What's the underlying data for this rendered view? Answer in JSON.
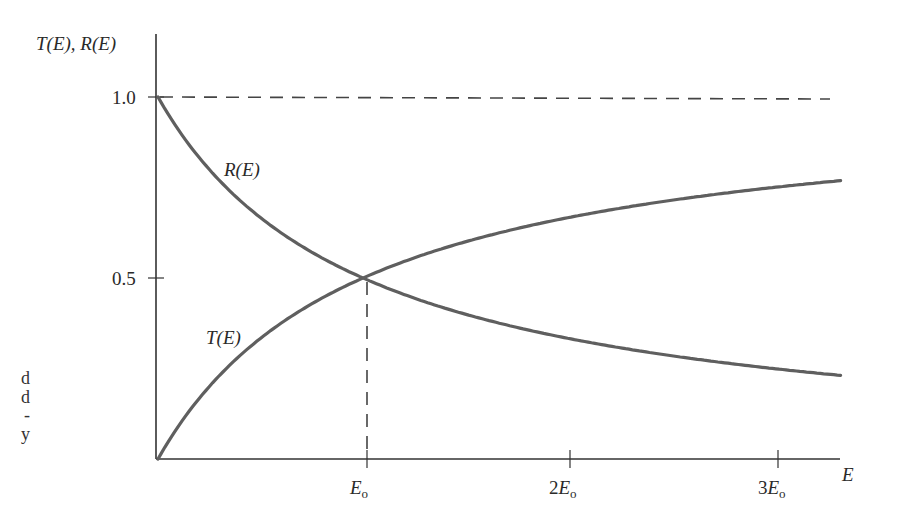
{
  "chart_data": {
    "type": "line",
    "title": "",
    "xlabel": "E",
    "ylabel": "T(E), R(E)",
    "x_ticks": [
      {
        "value": 1,
        "label": "E",
        "sub": "o"
      },
      {
        "value": 2,
        "label": "2E",
        "sub": "o"
      },
      {
        "value": 3,
        "label": "3E",
        "sub": "o"
      }
    ],
    "y_ticks": [
      {
        "value": 1.0,
        "label": "1.0"
      },
      {
        "value": 0.5,
        "label": "0.5"
      }
    ],
    "xlim": [
      0,
      3.4
    ],
    "ylim": [
      0,
      1.0
    ],
    "x_units": "E_o",
    "grid": false,
    "legend": "inline labels",
    "series": [
      {
        "name": "R(E)",
        "label": "R(E)",
        "x": [
          0,
          0.25,
          0.5,
          0.75,
          1.0,
          1.5,
          2.0,
          2.5,
          3.0,
          3.33
        ],
        "values": [
          1.0,
          0.8,
          0.667,
          0.571,
          0.5,
          0.4,
          0.333,
          0.286,
          0.25,
          0.23
        ]
      },
      {
        "name": "T(E)",
        "label": "T(E)",
        "x": [
          0,
          0.25,
          0.5,
          0.75,
          1.0,
          1.5,
          2.0,
          2.5,
          3.0,
          3.33
        ],
        "values": [
          0.0,
          0.2,
          0.333,
          0.429,
          0.5,
          0.6,
          0.667,
          0.714,
          0.75,
          0.77
        ]
      }
    ],
    "annotations": [
      {
        "type": "hline-dashed",
        "y": 1.0,
        "note": "asymptote at 1.0"
      },
      {
        "type": "vline-dashed",
        "x": 1,
        "from_y": 0,
        "to_y": 0.5,
        "note": "crossing at E = E_o, T = R = 0.5"
      }
    ]
  },
  "labels": {
    "y_axis": "T(E), R(E)",
    "x_axis": "E",
    "r_curve": "R(E)",
    "t_curve": "T(E)",
    "y_tick_1": "1.0",
    "y_tick_05": "0.5",
    "x_tick_1_main": "E",
    "x_tick_1_sub": "o",
    "x_tick_2_main": "2E",
    "x_tick_2_sub": "o",
    "x_tick_3_main": "3E",
    "x_tick_3_sub": "o"
  },
  "margin_fragments": [
    "d",
    "d",
    "-",
    "y"
  ]
}
